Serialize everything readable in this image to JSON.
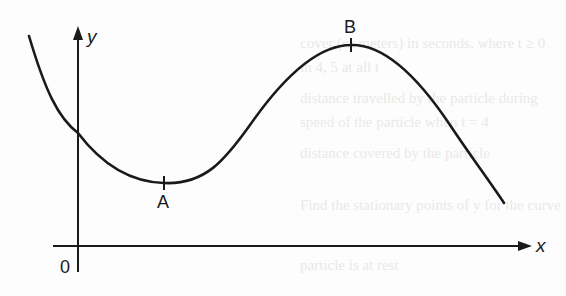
{
  "figure": {
    "type": "function-graph",
    "axes": {
      "x_label": "x",
      "y_label": "y",
      "origin_label": "0"
    },
    "points": [
      {
        "id": "A",
        "label": "A",
        "kind": "local-minimum",
        "label_position": "below"
      },
      {
        "id": "B",
        "label": "B",
        "kind": "local-maximum",
        "label_position": "above"
      }
    ],
    "colors": {
      "ink": "#1a1a1a",
      "background": "#fdfdfd",
      "bleed_through_text": "#d9d9d9"
    }
  },
  "labels": {
    "x_axis": "x",
    "y_axis": "y",
    "origin": "0",
    "point_a": "A",
    "point_b": "B"
  }
}
